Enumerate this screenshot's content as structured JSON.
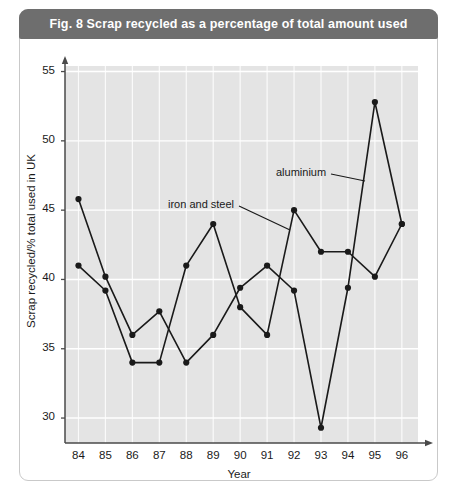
{
  "figure": {
    "title": "Fig. 8  Scrap recycled as a percentage of total amount used",
    "title_bar_color": "#6e6e6e",
    "card_border_color": "#c9c9c9",
    "background_color": "#ffffff"
  },
  "chart_data": {
    "type": "line",
    "title": "Fig. 8  Scrap recycled as a percentage of total amount used",
    "xlabel": "Year",
    "ylabel": "Scrap recycled/% total used in UK",
    "x": [
      84,
      85,
      86,
      87,
      88,
      89,
      90,
      91,
      92,
      93,
      94,
      95,
      96
    ],
    "xtick_labels": [
      "84",
      "85",
      "86",
      "87",
      "88",
      "89",
      "90",
      "91",
      "92",
      "93",
      "94",
      "95",
      "96"
    ],
    "ytick_labels": [
      "30",
      "35",
      "40",
      "45",
      "50",
      "55"
    ],
    "yticks": [
      30,
      35,
      40,
      45,
      50,
      55
    ],
    "xlim": [
      83.5,
      96.6
    ],
    "ylim": [
      28.2,
      55.4
    ],
    "grid": true,
    "grid_color": "#ffffff",
    "plot_background": "#e4e4e4",
    "legend": "annotated",
    "marker": "filled-circle",
    "line_color": "#1a1a1a",
    "series": [
      {
        "name": "iron and steel",
        "values": [
          41.0,
          39.2,
          34.0,
          34.0,
          41.0,
          44.0,
          38.0,
          36.0,
          45.0,
          42.0,
          42.0,
          40.2,
          44.0
        ]
      },
      {
        "name": "aluminium",
        "values": [
          45.8,
          40.2,
          36.0,
          37.7,
          34.0,
          36.0,
          39.4,
          41.0,
          39.2,
          29.3,
          39.4,
          52.8,
          44.0
        ]
      }
    ],
    "annotations": [
      {
        "label": "aluminium",
        "text_x": 276,
        "text_y": 174,
        "leader_to_x": 365,
        "leader_to_y": 181
      },
      {
        "label": "iron and steel",
        "text_x": 168,
        "text_y": 206,
        "leader_to_x": 290,
        "leader_to_y": 230
      }
    ]
  }
}
